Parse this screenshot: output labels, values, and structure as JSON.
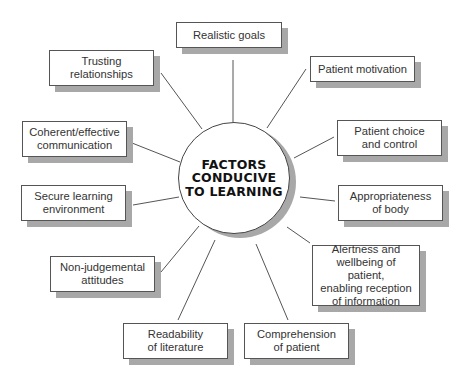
{
  "diagram": {
    "type": "hub-and-spoke",
    "center": {
      "lines": [
        "FACTORS",
        "CONDUCIVE",
        "TO LEARNING"
      ]
    },
    "nodes": [
      {
        "id": "realistic-goals",
        "lines": [
          "Realistic goals"
        ],
        "x": 176,
        "y": 22,
        "w": 106,
        "h": 26
      },
      {
        "id": "trusting-relationships",
        "lines": [
          "Trusting",
          "relationships"
        ],
        "x": 49,
        "y": 50,
        "w": 105,
        "h": 36
      },
      {
        "id": "patient-motivation",
        "lines": [
          "Patient motivation"
        ],
        "x": 310,
        "y": 56,
        "w": 105,
        "h": 26
      },
      {
        "id": "coherent-communication",
        "lines": [
          "Coherent/effective",
          "communication"
        ],
        "x": 22,
        "y": 121,
        "w": 105,
        "h": 36
      },
      {
        "id": "patient-choice",
        "lines": [
          "Patient choice",
          "and control"
        ],
        "x": 337,
        "y": 120,
        "w": 105,
        "h": 36
      },
      {
        "id": "secure-environment",
        "lines": [
          "Secure learning",
          "environment"
        ],
        "x": 21,
        "y": 185,
        "w": 105,
        "h": 36
      },
      {
        "id": "appropriateness-of-body",
        "lines": [
          "Appropriateness",
          "of body"
        ],
        "x": 338,
        "y": 185,
        "w": 105,
        "h": 36
      },
      {
        "id": "alertness-wellbeing",
        "lines": [
          "Alertness and",
          "wellbeing of patient,",
          "enabling reception",
          "of information"
        ],
        "x": 312,
        "y": 245,
        "w": 108,
        "h": 61
      },
      {
        "id": "non-judgemental",
        "lines": [
          "Non-judgemental",
          "attitudes"
        ],
        "x": 50,
        "y": 256,
        "w": 105,
        "h": 36
      },
      {
        "id": "readability",
        "lines": [
          "Readability",
          "of literature"
        ],
        "x": 123,
        "y": 323,
        "w": 105,
        "h": 36
      },
      {
        "id": "comprehension",
        "lines": [
          "Comprehension",
          "of patient"
        ],
        "x": 244,
        "y": 323,
        "w": 105,
        "h": 36
      }
    ],
    "links": [
      {
        "to": "realistic-goals",
        "x1": 233,
        "y1": 60,
        "x2": 233,
        "y2": 122
      },
      {
        "to": "trusting-relationships",
        "x1": 161,
        "y1": 73,
        "x2": 202,
        "y2": 129
      },
      {
        "to": "patient-motivation",
        "x1": 306,
        "y1": 69,
        "x2": 267,
        "y2": 128
      },
      {
        "to": "coherent-communication",
        "x1": 132,
        "y1": 143,
        "x2": 180,
        "y2": 162
      },
      {
        "to": "patient-choice",
        "x1": 334,
        "y1": 137,
        "x2": 294,
        "y2": 158
      },
      {
        "to": "secure-environment",
        "x1": 133,
        "y1": 205,
        "x2": 179,
        "y2": 197
      },
      {
        "to": "appropriateness-of-body",
        "x1": 335,
        "y1": 201,
        "x2": 300,
        "y2": 197
      },
      {
        "to": "alertness-wellbeing",
        "x1": 310,
        "y1": 243,
        "x2": 287,
        "y2": 227
      },
      {
        "to": "non-judgemental",
        "x1": 161,
        "y1": 272,
        "x2": 199,
        "y2": 226
      },
      {
        "to": "readability",
        "x1": 178,
        "y1": 320,
        "x2": 215,
        "y2": 240
      },
      {
        "to": "comprehension",
        "x1": 288,
        "y1": 320,
        "x2": 256,
        "y2": 244
      }
    ],
    "colors": {
      "box_border": "#555555",
      "shadow": "#a8a8a8",
      "line": "#555555",
      "text": "#333333",
      "center_text": "#111111"
    }
  }
}
